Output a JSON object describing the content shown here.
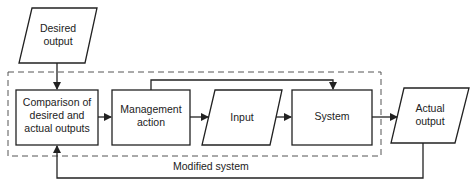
{
  "diagram": {
    "type": "flowchart",
    "colors": {
      "stroke": "#222222",
      "dash": "#555555",
      "background": "#ffffff"
    },
    "nodes": [
      {
        "id": "desired_output",
        "shape": "parallelogram",
        "lines": [
          "Desired",
          "output"
        ]
      },
      {
        "id": "comparison",
        "shape": "rectangle",
        "lines": [
          "Comparison of",
          "desired and",
          "actual outputs"
        ]
      },
      {
        "id": "management_action",
        "shape": "rectangle",
        "lines": [
          "Management",
          "action"
        ]
      },
      {
        "id": "input",
        "shape": "parallelogram",
        "lines": [
          "Input"
        ]
      },
      {
        "id": "system",
        "shape": "rectangle",
        "lines": [
          "System"
        ]
      },
      {
        "id": "actual_output",
        "shape": "parallelogram",
        "lines": [
          "Actual",
          "output"
        ]
      }
    ],
    "edges": [
      {
        "from": "desired_output",
        "to": "comparison"
      },
      {
        "from": "comparison",
        "to": "management_action"
      },
      {
        "from": "management_action",
        "to": "input"
      },
      {
        "from": "management_action",
        "to": "system",
        "route": "over-top"
      },
      {
        "from": "input",
        "to": "system"
      },
      {
        "from": "system",
        "to": "actual_output"
      },
      {
        "from": "actual_output",
        "to": "comparison",
        "route": "feedback-below"
      }
    ],
    "group": {
      "style": "dashed",
      "label": "Modified system",
      "contains": [
        "comparison",
        "management_action",
        "input",
        "system"
      ]
    }
  }
}
